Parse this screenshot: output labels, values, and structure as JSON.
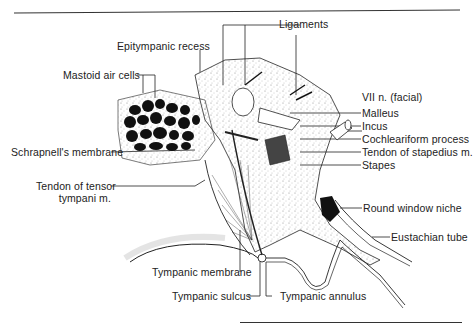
{
  "figure": {
    "colors": {
      "ink": "#1a1a1a",
      "stipple": "#888888",
      "background": "#ffffff"
    }
  },
  "labels": {
    "ligaments": "Ligaments",
    "epitympanic_recess": "Epitympanic recess",
    "mastoid_air_cells": "Mastoid air cells",
    "vii_nerve": "VII n. (facial)",
    "malleus": "Malleus",
    "incus": "Incus",
    "cochleariform_process": "Cochleariform process",
    "tendon_stapedius": "Tendon of stapedius m.",
    "stapes": "Stapes",
    "schrapnells_membrane": "Schrapnell's membrane",
    "tendon_tensor_line1": "Tendon of tensor",
    "tendon_tensor_line2": "tympani m.",
    "round_window_niche": "Round window niche",
    "eustachian_tube": "Eustachian tube",
    "tympanic_membrane": "Tympanic membrane",
    "tympanic_sulcus": "Tympanic sulcus",
    "tympanic_annulus": "Tympanic annulus"
  }
}
